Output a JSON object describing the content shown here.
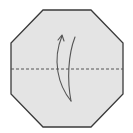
{
  "diagram": {
    "type": "origami-step",
    "shape": "octagon",
    "colors": {
      "paper_fill": "#e4e4e4",
      "outline": "#3a3a3a",
      "fold_line": "#555555",
      "arrow": "#555555",
      "background": "#ffffff"
    },
    "octagon_points": "43,10 91,10 123,43 123,94 91,127 43,127 11,94 11,43",
    "fold_line": {
      "style": "dashed",
      "kind": "valley-fold",
      "y": 69,
      "x1": 11,
      "x2": 123
    },
    "arrow": {
      "meaning": "fold bottom half up",
      "direction": "up"
    }
  }
}
